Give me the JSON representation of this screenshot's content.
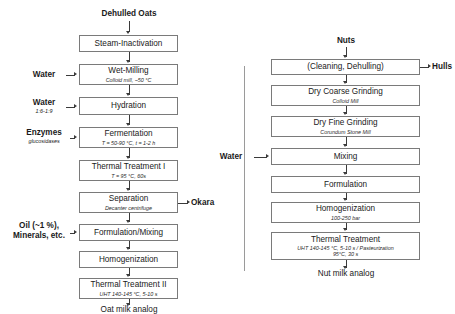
{
  "diagram": {
    "colors": {
      "box_border": "#7a7a7a",
      "connector": "#3a3a3a",
      "divider": "#9a9a9a",
      "text": "#1a1a1a"
    }
  },
  "oat_process": {
    "input_label": "Dehulled Oats",
    "output_label": "Oat milk analog",
    "steps": [
      {
        "title": "Steam-Inactivation",
        "sub": "",
        "sub2": ""
      },
      {
        "title": "Wet-Milling",
        "sub": "Colloid mill, ~50 °C",
        "sub2": ""
      },
      {
        "title": "Hydration",
        "sub": "",
        "sub2": ""
      },
      {
        "title": "Fermentation",
        "sub": "T = 50-90 °C, t = 1-2 h",
        "sub2": ""
      },
      {
        "title": "Thermal Treatment I",
        "sub": "T = 95 °C, 60s",
        "sub2": ""
      },
      {
        "title": "Separation",
        "sub": "Decanter centrifuge",
        "sub2": ""
      },
      {
        "title": "Formulation/Mixing",
        "sub": "",
        "sub2": ""
      },
      {
        "title": "Homogenization",
        "sub": "",
        "sub2": ""
      },
      {
        "title": "Thermal Treatment II",
        "sub": "UHT 140-145 °C, 5-10 s",
        "sub2": ""
      }
    ],
    "inputs": [
      {
        "name": "Water",
        "detail": ""
      },
      {
        "name": "Water",
        "detail": "1:6-1:9"
      },
      {
        "name": "Enzymes",
        "detail": "glucosidases"
      },
      {
        "name": "Oil (~1 %),",
        "detail": "Minerals, etc."
      }
    ],
    "side_output": "Okara"
  },
  "nut_process": {
    "input_label": "Nuts",
    "output_label": "Nut milk analog",
    "steps": [
      {
        "title": "(Cleaning, Dehulling)",
        "sub": "",
        "sub2": ""
      },
      {
        "title": "Dry Coarse Grinding",
        "sub": "Colloid Mill",
        "sub2": ""
      },
      {
        "title": "Dry Fine Grinding",
        "sub": "Corundum Stone Mill",
        "sub2": ""
      },
      {
        "title": "Mixing",
        "sub": "",
        "sub2": ""
      },
      {
        "title": "Formulation",
        "sub": "",
        "sub2": ""
      },
      {
        "title": "Homogenization",
        "sub": "100-250 bar",
        "sub2": ""
      },
      {
        "title": "Thermal Treatment",
        "sub": "UHT 140-145 °C, 5-10 s / Pasteurization",
        "sub2": "95°C, 30 s"
      }
    ],
    "inputs": [
      {
        "name": "Water",
        "detail": ""
      }
    ],
    "side_output": "Hulls"
  }
}
